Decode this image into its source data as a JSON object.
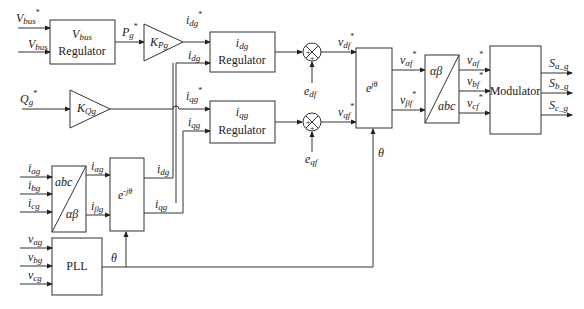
{
  "blocks": {
    "vbus_regulator": {
      "line1": "V",
      "line1_sub": "bus",
      "line2": "Regulator"
    },
    "kpg": {
      "label": "K",
      "sub": "Pg"
    },
    "kqg": {
      "label": "K",
      "sub": "Qg"
    },
    "idg_regulator": {
      "line1": "i",
      "line1_sub": "dg",
      "line2": "Regulator"
    },
    "iqg_regulator": {
      "line1": "i",
      "line1_sub": "qg",
      "line2": "Regulator"
    },
    "dq_to_alphabeta": {
      "label": "e",
      "sup": "jθ"
    },
    "alphabeta_to_abc": {
      "top": "αβ",
      "bottom": "abc"
    },
    "modulator": {
      "label": "Modulator"
    },
    "abc_to_alphabeta": {
      "top": "abc",
      "bottom": "αβ"
    },
    "abc_park": {
      "label": "e",
      "sup": "-jθ"
    },
    "pll": {
      "label": "PLL"
    }
  },
  "signals": {
    "vbus_ref": {
      "main": "V",
      "sub": "bus",
      "sup": "*"
    },
    "vbus": {
      "main": "V",
      "sub": "bus"
    },
    "pg_ref": {
      "main": "P",
      "sub": "g",
      "sup": "*"
    },
    "qg_ref": {
      "main": "Q",
      "sub": "g",
      "sup": "*"
    },
    "idg_ref": {
      "main": "i",
      "sub": "dg",
      "sup": "*"
    },
    "idg": {
      "main": "i",
      "sub": "dg"
    },
    "iqg_ref": {
      "main": "i",
      "sub": "qg",
      "sup": "*"
    },
    "iqg": {
      "main": "i",
      "sub": "qg"
    },
    "edf": {
      "main": "e",
      "sub": "df"
    },
    "eqf": {
      "main": "e",
      "sub": "qf"
    },
    "vdf_ref": {
      "main": "v",
      "sub": "df",
      "sup": "*"
    },
    "vqf_ref": {
      "main": "v",
      "sub": "qf",
      "sup": "*"
    },
    "valphaf_ref": {
      "main": "v",
      "sub": "αf",
      "sup": "*"
    },
    "vbetaf_ref": {
      "main": "v",
      "sub": "βf",
      "sup": "*"
    },
    "vaf_ref": {
      "main": "v",
      "sub": "af",
      "sup": "*"
    },
    "vbf_ref": {
      "main": "v",
      "sub": "bf",
      "sup": "*"
    },
    "vcf_ref": {
      "main": "v",
      "sub": "cf",
      "sup": "*"
    },
    "sag": {
      "main": "S",
      "sub": "a_g"
    },
    "sbg": {
      "main": "S",
      "sub": "b_g"
    },
    "scg": {
      "main": "S",
      "sub": "c_g"
    },
    "iag": {
      "main": "i",
      "sub": "ag"
    },
    "ibg": {
      "main": "i",
      "sub": "bg"
    },
    "icg": {
      "main": "i",
      "sub": "cg"
    },
    "ialphag": {
      "main": "i",
      "sub": "αg"
    },
    "ibetag": {
      "main": "i",
      "sub": "βg"
    },
    "idg_fb": {
      "main": "i",
      "sub": "dg"
    },
    "iqg_fb": {
      "main": "i",
      "sub": "qg"
    },
    "vag": {
      "main": "v",
      "sub": "ag"
    },
    "vbg": {
      "main": "v",
      "sub": "bg"
    },
    "vcg": {
      "main": "v",
      "sub": "cg"
    },
    "theta": {
      "main": "θ"
    },
    "theta2": {
      "main": "θ"
    }
  },
  "summers": {
    "plus": "+"
  }
}
